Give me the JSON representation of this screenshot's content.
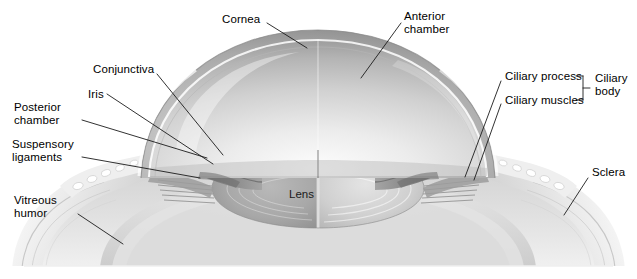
{
  "figure": {
    "type": "anatomical-illustration",
    "width": 637,
    "height": 279,
    "background_color": "#ffffff",
    "label_color": "#000000",
    "leader_color": "#1b1b1b"
  },
  "labels": [
    {
      "id": "cornea",
      "text": "Cornea",
      "lines": [
        "Cornea"
      ],
      "x": 222,
      "y": 13,
      "align": "left",
      "leader": {
        "x1": 267,
        "y1": 23,
        "x2": 307,
        "y2": 48
      }
    },
    {
      "id": "anterior-chamber",
      "text": "Anterior chamber",
      "lines": [
        "Anterior",
        "chamber"
      ],
      "x": 404,
      "y": 10,
      "align": "left",
      "leader": {
        "x1": 401,
        "y1": 23,
        "x2": 361,
        "y2": 78
      }
    },
    {
      "id": "conjunctiva",
      "text": "Conjunctiva",
      "lines": [
        "Conjunctiva"
      ],
      "x": 93,
      "y": 63,
      "align": "left",
      "leader": {
        "x1": 157,
        "y1": 74,
        "x2": 223,
        "y2": 155
      }
    },
    {
      "id": "iris",
      "text": "Iris",
      "lines": [
        "Iris"
      ],
      "x": 88,
      "y": 88,
      "align": "left",
      "leader": {
        "x1": 107,
        "y1": 94,
        "x2": 213,
        "y2": 164
      }
    },
    {
      "id": "posterior-chamber",
      "text": "Posterior chamber",
      "lines": [
        "Posterior",
        "chamber"
      ],
      "x": 14,
      "y": 101,
      "align": "left",
      "leader": {
        "x1": 82,
        "y1": 120,
        "x2": 207,
        "y2": 158
      }
    },
    {
      "id": "suspensory-ligaments",
      "text": "Suspensory ligaments",
      "lines": [
        "Suspensory",
        "ligaments"
      ],
      "x": 12,
      "y": 138,
      "align": "left",
      "leader": {
        "x1": 82,
        "y1": 157,
        "x2": 200,
        "y2": 178
      }
    },
    {
      "id": "vitreous-humor",
      "text": "Vitreous humor",
      "lines": [
        "Vitreous",
        "humor"
      ],
      "x": 14,
      "y": 194,
      "align": "left",
      "leader": {
        "x1": 78,
        "y1": 214,
        "x2": 123,
        "y2": 244
      }
    },
    {
      "id": "ciliary-process",
      "text": "Ciliary process",
      "lines": [
        "Ciliary process"
      ],
      "x": 505,
      "y": 70,
      "align": "left",
      "leader": {
        "x1": 501,
        "y1": 81,
        "x2": 465,
        "y2": 177
      }
    },
    {
      "id": "ciliary-muscles",
      "text": "Ciliary muscles",
      "lines": [
        "Ciliary muscles"
      ],
      "x": 505,
      "y": 94,
      "align": "left",
      "leader": {
        "x1": 501,
        "y1": 104,
        "x2": 474,
        "y2": 180
      }
    },
    {
      "id": "ciliary-body",
      "text": "Ciliary body",
      "lines": [
        "Ciliary",
        "body"
      ],
      "x": 595,
      "y": 72,
      "align": "left",
      "bracket": {
        "x": 583,
        "y_top": 76,
        "y_bottom": 100,
        "arm": 7,
        "tick": 6
      }
    },
    {
      "id": "sclera",
      "text": "Sclera",
      "lines": [
        "Sclera"
      ],
      "x": 592,
      "y": 166,
      "align": "left",
      "leader": {
        "x1": 588,
        "y1": 178,
        "x2": 564,
        "y2": 215
      }
    },
    {
      "id": "lens",
      "text": "Lens",
      "lines": [
        "Lens"
      ],
      "x": 289,
      "y": 188,
      "align": "left",
      "leader": null
    }
  ]
}
